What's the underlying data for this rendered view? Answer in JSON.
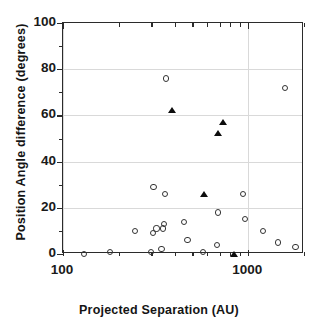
{
  "chart_data": {
    "type": "scatter",
    "title": "",
    "xlabel": "Projected Separation  (AU)",
    "ylabel": "Position Angle difference  (degrees)",
    "xscale": "log",
    "yscale": "linear",
    "xlim": [
      100,
      2000
    ],
    "ylim": [
      0,
      100
    ],
    "xticks": [
      100,
      1000
    ],
    "xtick_labels": [
      "100",
      "1000"
    ],
    "yticks": [
      0,
      20,
      40,
      60,
      80,
      100
    ],
    "ytick_labels": [
      "0",
      "20",
      "40",
      "60",
      "80",
      "100"
    ],
    "grid": true,
    "legend": "none",
    "series": [
      {
        "name": "open-circles",
        "marker": "open circle",
        "color": "#333333",
        "points": [
          {
            "x": 130,
            "y": 0
          },
          {
            "x": 180,
            "y": 1
          },
          {
            "x": 245,
            "y": 10
          },
          {
            "x": 300,
            "y": 1
          },
          {
            "x": 305,
            "y": 9
          },
          {
            "x": 308,
            "y": 29
          },
          {
            "x": 320,
            "y": 11
          },
          {
            "x": 340,
            "y": 2
          },
          {
            "x": 345,
            "y": 11
          },
          {
            "x": 350,
            "y": 13
          },
          {
            "x": 355,
            "y": 26
          },
          {
            "x": 360,
            "y": 76
          },
          {
            "x": 450,
            "y": 14
          },
          {
            "x": 470,
            "y": 6
          },
          {
            "x": 570,
            "y": 1
          },
          {
            "x": 680,
            "y": 4
          },
          {
            "x": 690,
            "y": 18
          },
          {
            "x": 940,
            "y": 26
          },
          {
            "x": 960,
            "y": 15
          },
          {
            "x": 1200,
            "y": 10
          },
          {
            "x": 1450,
            "y": 5
          },
          {
            "x": 1580,
            "y": 72
          },
          {
            "x": 1800,
            "y": 3
          }
        ]
      },
      {
        "name": "filled-triangles",
        "marker": "filled triangle",
        "color": "#0d0d0d",
        "points": [
          {
            "x": 390,
            "y": 62
          },
          {
            "x": 580,
            "y": 26
          },
          {
            "x": 690,
            "y": 52
          },
          {
            "x": 730,
            "y": 57
          },
          {
            "x": 840,
            "y": 0
          }
        ]
      }
    ]
  },
  "axes": {
    "x_title": "Projected Separation  (AU)",
    "y_title": "Position Angle difference  (degrees)"
  }
}
